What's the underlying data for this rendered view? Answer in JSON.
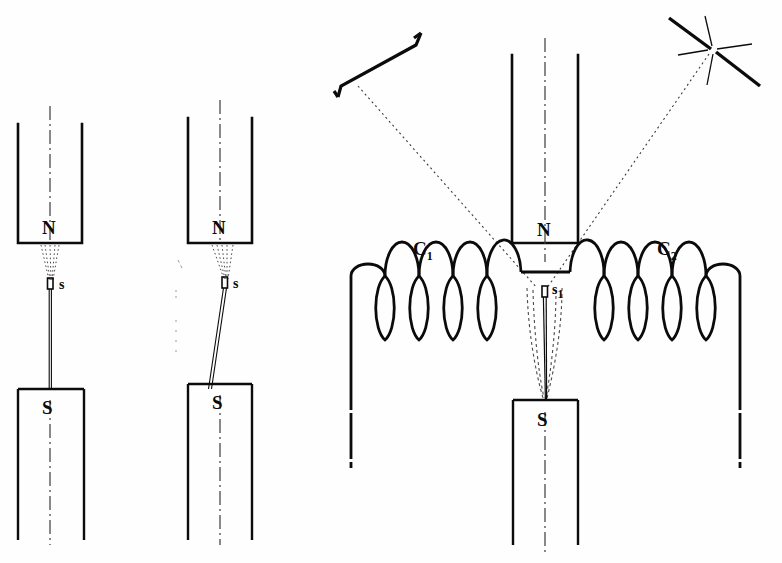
{
  "figure": {
    "background_color": "#fefefe",
    "ink_color": "#0b0b0b",
    "faint_ink_color": "#6e6e6e",
    "width": 782,
    "height": 563
  },
  "panels": [
    {
      "id": "panel-left",
      "name": "undeflected-specimen",
      "north_pole_label": "N",
      "south_pole_label": "S",
      "specimen_label": "s",
      "centerline_style": "dash-dot",
      "thread_state": "vertical",
      "flux_lines": "dotted-converging"
    },
    {
      "id": "panel-middle",
      "name": "deflected-specimen",
      "north_pole_label": "N",
      "south_pole_label": "S",
      "specimen_label": "s",
      "centerline_style": "dash-dot",
      "thread_state": "tilted",
      "flux_lines": "dotted-converging"
    },
    {
      "id": "panel-right",
      "name": "coil-apparatus",
      "north_pole_label": "N",
      "south_pole_label": "S",
      "specimen_label": "s",
      "specimen_sublabel": "1",
      "coil_left_label": "C",
      "coil_left_sublabel": "1",
      "coil_right_label": "C",
      "coil_right_sublabel": "2",
      "coil_left_turns": 5,
      "coil_right_turns": 5,
      "light_source": "star-burst",
      "observation_screen": "scale-bar",
      "sight_lines": "dotted"
    }
  ],
  "legend": {
    "pole_north": "N",
    "pole_south": "S",
    "specimen": "s",
    "coil_one": "C1",
    "coil_two": "C2"
  }
}
